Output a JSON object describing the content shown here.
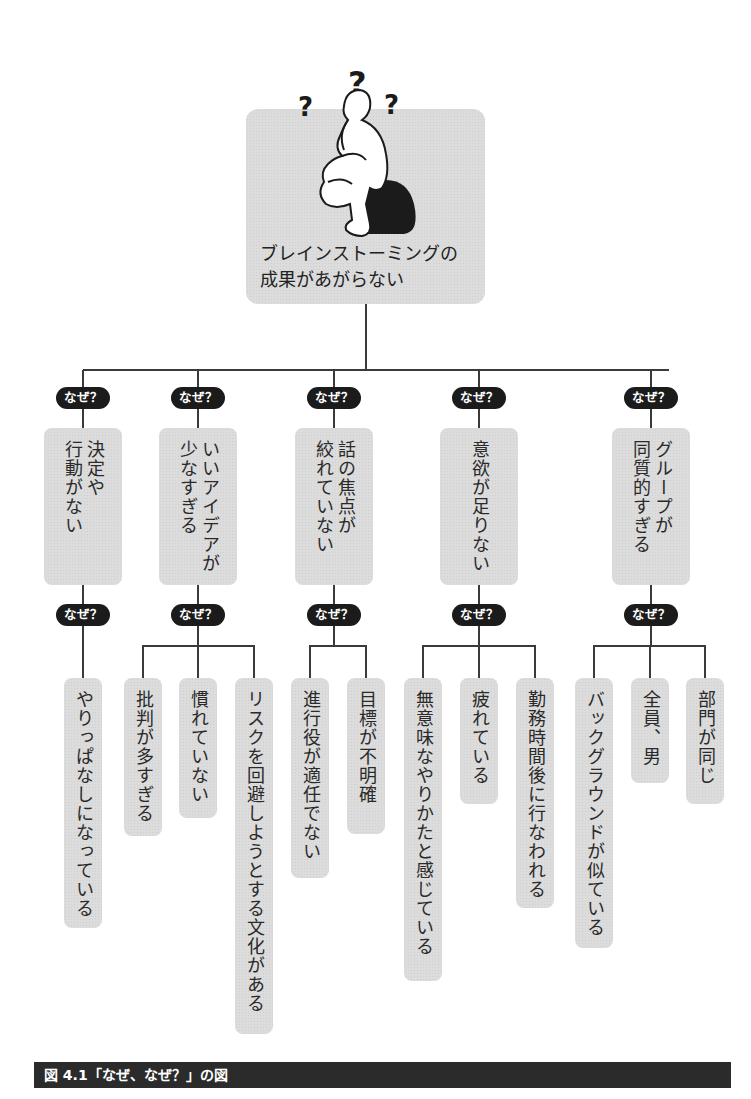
{
  "root": {
    "text": "ブレインストーミングの\n成果があがらない",
    "illustration": "thinker-figure-with-question-marks"
  },
  "why_badge_label": "なぜ？",
  "causes": [
    {
      "text": "決定や\n行動がない",
      "sub": [
        "やりっぱなしになっている"
      ]
    },
    {
      "text": "いいアイデアが\n少なすぎる",
      "sub": [
        "批判が多すぎる",
        "慣れていない",
        "リスクを回避しようとする文化がある"
      ]
    },
    {
      "text": "話の焦点が\n絞れていない",
      "sub": [
        "進行役が適任でない",
        "目標が不明確"
      ]
    },
    {
      "text": "意欲が足りない",
      "sub": [
        "無意味なやりかたと感じている",
        "疲れている",
        "勤務時間後に行なわれる"
      ]
    },
    {
      "text": "グループが\n同質的すぎる",
      "sub": [
        "バックグラウンドが似ている",
        "全員、男",
        "部門が同じ"
      ]
    }
  ],
  "caption": "図 4.1「なぜ、なぜ？」の図",
  "colors": {
    "box": "#dcdcdc",
    "badge": "#1b1b1b",
    "line": "#3a3a3a",
    "caption_bg": "#2b2b2b"
  }
}
